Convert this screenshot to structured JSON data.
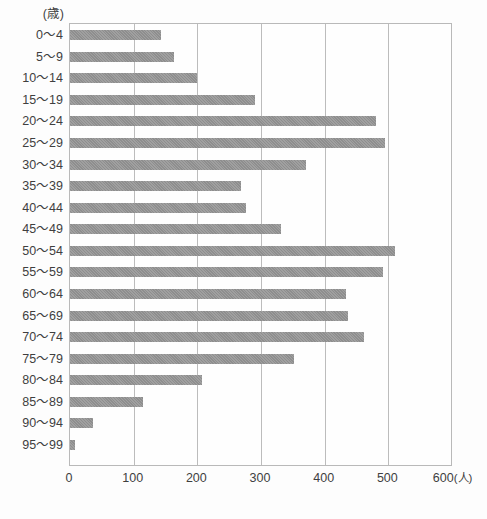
{
  "chart_data": {
    "type": "bar",
    "orientation": "horizontal",
    "title": "",
    "subtitle": "",
    "xlabel": "(人)",
    "ylabel": "(歳)",
    "xlim": [
      0,
      600
    ],
    "ylim": null,
    "grid": true,
    "legend": null,
    "x_ticks": [
      "0",
      "100",
      "200",
      "300",
      "400",
      "500",
      "600"
    ],
    "x_tick_values": [
      0,
      100,
      200,
      300,
      400,
      500,
      600
    ],
    "x_unit_label": "(人)",
    "y_unit_label": "(歳)",
    "categories": [
      "0〜4",
      "5〜9",
      "10〜14",
      "15〜19",
      "20〜24",
      "25〜29",
      "30〜34",
      "35〜39",
      "40〜44",
      "45〜49",
      "50〜54",
      "55〜59",
      "60〜64",
      "65〜69",
      "70〜74",
      "75〜79",
      "80〜84",
      "85〜89",
      "90〜94",
      "95〜99"
    ],
    "values": [
      143,
      163,
      200,
      291,
      481,
      494,
      370,
      268,
      277,
      332,
      510,
      491,
      434,
      437,
      462,
      352,
      208,
      115,
      36,
      8
    ],
    "bar_color": "#8e8e8e",
    "frame_color": "#b9b9b9",
    "grid_color": "#bcbcbc",
    "background_color": "#fdfdfd"
  }
}
